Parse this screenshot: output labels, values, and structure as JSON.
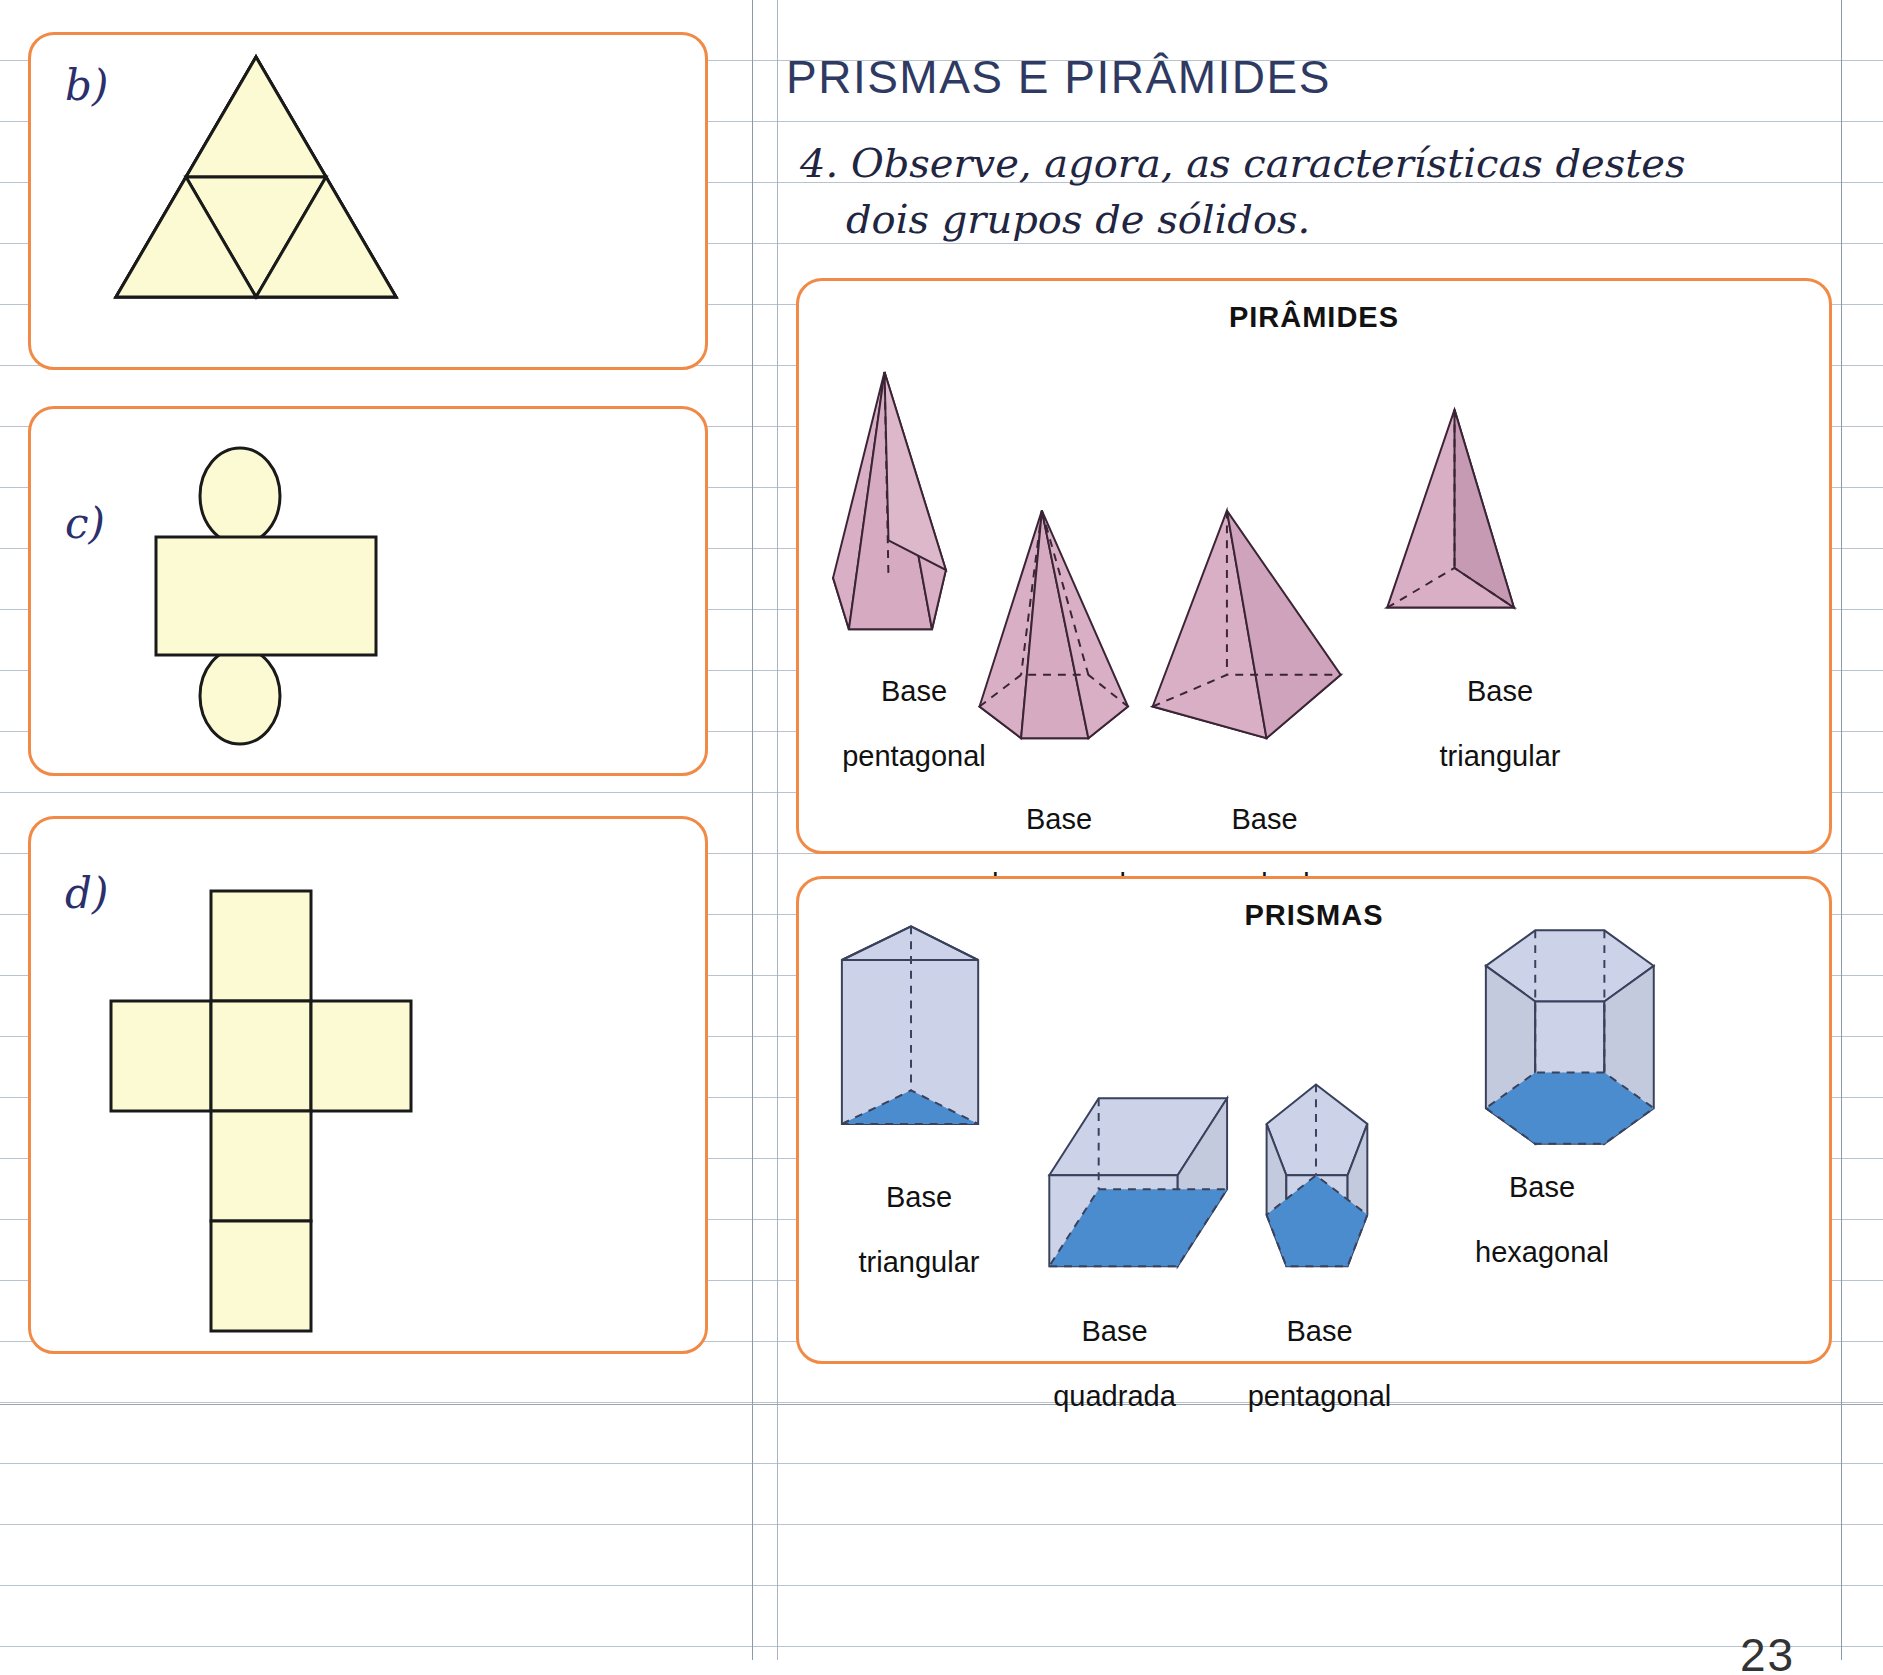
{
  "page": {
    "number": "23",
    "section_title": "PRISMAS E PIRÂMIDES",
    "exercise_text_line1": "4. Observe, agora, as características destes",
    "exercise_text_line2": "dois grupos de sólidos.",
    "colors": {
      "card_border": "#f08a46",
      "title_blue": "#2f3a63",
      "net_fill": "#fbfad2",
      "net_stroke": "#1a1a1a",
      "pyramid_light": "#d8afc4",
      "pyramid_dark": "#8a6382",
      "prism_light": "#ccd2e8",
      "prism_base_blue": "#4a8ccd",
      "rule_line": "#b9c2cf"
    }
  },
  "left_panels": [
    {
      "letter": "b)",
      "net_name": "triangular-pyramid-net"
    },
    {
      "letter": "c)",
      "net_name": "cylinder-net"
    },
    {
      "letter": "d)",
      "net_name": "cube-net"
    }
  ],
  "piramides": {
    "heading": "PIRÂMIDES",
    "solids": [
      {
        "label_line1": "Base",
        "label_line2": "pentagonal",
        "shape": "pentagonal-pyramid"
      },
      {
        "label_line1": "Base",
        "label_line2": "hexagonal",
        "shape": "hexagonal-pyramid"
      },
      {
        "label_line1": "Base",
        "label_line2": "quadrada",
        "shape": "square-pyramid"
      },
      {
        "label_line1": "Base",
        "label_line2": "triangular",
        "shape": "triangular-pyramid"
      }
    ]
  },
  "prismas": {
    "heading": "PRISMAS",
    "solids": [
      {
        "label_line1": "Base",
        "label_line2": "triangular",
        "shape": "triangular-prism"
      },
      {
        "label_line1": "Base",
        "label_line2": "quadrada",
        "shape": "square-prism"
      },
      {
        "label_line1": "Base",
        "label_line2": "pentagonal",
        "shape": "pentagonal-prism"
      },
      {
        "label_line1": "Base",
        "label_line2": "hexagonal",
        "shape": "hexagonal-prism"
      }
    ]
  }
}
